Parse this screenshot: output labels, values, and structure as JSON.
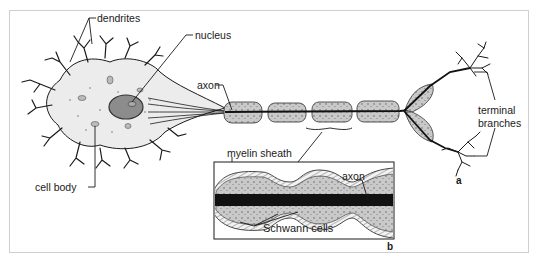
{
  "figure": {
    "labels": {
      "dendrites": "dendrites",
      "nucleus": "nucleus",
      "axon": "axon",
      "cell_body": "cell body",
      "terminal_branches_line1": "terminal",
      "terminal_branches_line2": "branches",
      "myelin_sheath": "myelin sheath",
      "inset_axon": "axon",
      "schwann_cells": "Schwann cells"
    },
    "panels": {
      "a": "a",
      "b": "b"
    },
    "colors": {
      "ink": "#1a1a1a",
      "cell_fill": "#ececec",
      "nucleus_fill": "#8c8c8c",
      "myelin_fill": "#c8c8c8",
      "myelin_outer": "#e6e6e6",
      "axon_core": "#111111",
      "frame_border": "#cfcfcf"
    }
  }
}
